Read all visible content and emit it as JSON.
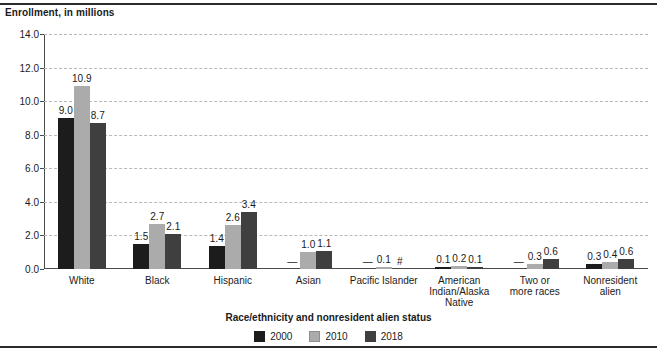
{
  "chart_data": {
    "type": "bar",
    "title": "",
    "ylabel": "Enrollment, in millions",
    "xlabel": "Race/ethnicity and nonresident alien status",
    "ylim": [
      0.0,
      14.0
    ],
    "ytick_step": 2.0,
    "ytick_labels": [
      "0.0",
      "2.0",
      "4.0",
      "6.0",
      "8.0",
      "10.0",
      "12.0",
      "14.0"
    ],
    "ytick_values": [
      0.0,
      2.0,
      4.0,
      6.0,
      8.0,
      10.0,
      12.0,
      14.0
    ],
    "grid": "horizontal-dashed",
    "legend_position": "bottom-center",
    "categories": [
      "White",
      "Black",
      "Hispanic",
      "Asian",
      "Pacific Islander",
      "American Indian/Alaska Native",
      "Two or more races",
      "Nonresident alien"
    ],
    "category_label_lines": [
      [
        "White"
      ],
      [
        "Black"
      ],
      [
        "Hispanic"
      ],
      [
        "Asian"
      ],
      [
        "Pacific Islander"
      ],
      [
        "American",
        "Indian/Alaska",
        "Native"
      ],
      [
        "Two or",
        "more races"
      ],
      [
        "Nonresident",
        "alien"
      ]
    ],
    "series": [
      {
        "name": "2000",
        "color": "#1c1c1c",
        "values": [
          9.0,
          1.5,
          1.4,
          null,
          null,
          0.1,
          null,
          0.3
        ],
        "labels": [
          "9.0",
          "1.5",
          "1.4",
          "—",
          "—",
          "0.1",
          "—",
          "0.3"
        ]
      },
      {
        "name": "2010",
        "color": "#ababab",
        "values": [
          10.9,
          2.7,
          2.6,
          1.0,
          0.1,
          0.2,
          0.3,
          0.4
        ],
        "labels": [
          "10.9",
          "2.7",
          "2.6",
          "1.0",
          "0.1",
          "0.2",
          "0.3",
          "0.4"
        ]
      },
      {
        "name": "2018",
        "color": "#3f3f3f",
        "values": [
          8.7,
          2.1,
          3.4,
          1.1,
          0.0,
          0.1,
          0.6,
          0.6
        ],
        "labels": [
          "8.7",
          "2.1",
          "3.4",
          "1.1",
          "#",
          "0.1",
          "0.6",
          "0.6"
        ]
      }
    ],
    "annotations": {
      "dash_meaning": "—",
      "rounds_to_zero_symbol": "#"
    }
  }
}
